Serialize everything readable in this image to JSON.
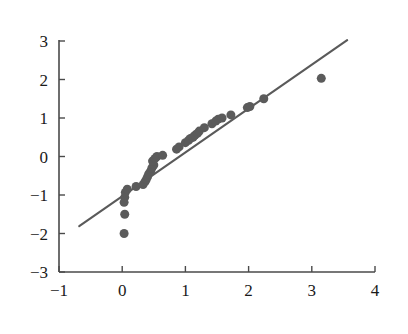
{
  "chart_data": {
    "type": "scatter",
    "title": "",
    "subtitle": "",
    "xlabel": "",
    "ylabel": "",
    "xlim": [
      -1,
      4
    ],
    "ylim": [
      -3,
      3
    ],
    "xticks": [
      -1,
      0,
      1,
      2,
      3,
      4
    ],
    "yticks": [
      -3,
      -2,
      -1,
      0,
      1,
      2,
      3
    ],
    "xtick_labels": [
      "−1",
      "0",
      "1",
      "2",
      "3",
      "4"
    ],
    "ytick_labels": [
      "−3",
      "−2",
      "−1",
      "0",
      "1",
      "2",
      "3"
    ],
    "grid": false,
    "legend": null,
    "marker_color": "#5b5b5b",
    "marker_size": 9,
    "line_color": "#5a5a5a",
    "axis_color": "#4a4a4a",
    "background_color": "#ffffff",
    "spines": [
      "left",
      "bottom"
    ],
    "reference_line": {
      "name": "reference-line",
      "x_start": -0.68,
      "y_start": -1.81,
      "x_end": 3.56,
      "y_end": 3.02,
      "slope": 1.14,
      "intercept": -1.03
    },
    "series": [
      {
        "name": "observations",
        "points": [
          [
            0.03,
            -2.0
          ],
          [
            0.04,
            -1.5
          ],
          [
            0.03,
            -1.19
          ],
          [
            0.04,
            -1.06
          ],
          [
            0.05,
            -0.93
          ],
          [
            0.08,
            -0.85
          ],
          [
            0.22,
            -0.78
          ],
          [
            0.33,
            -0.73
          ],
          [
            0.36,
            -0.66
          ],
          [
            0.38,
            -0.6
          ],
          [
            0.4,
            -0.53
          ],
          [
            0.42,
            -0.45
          ],
          [
            0.45,
            -0.38
          ],
          [
            0.47,
            -0.3
          ],
          [
            0.5,
            -0.22
          ],
          [
            0.48,
            -0.12
          ],
          [
            0.52,
            -0.05
          ],
          [
            0.55,
            0.0
          ],
          [
            0.64,
            0.03
          ],
          [
            0.86,
            0.19
          ],
          [
            0.9,
            0.25
          ],
          [
            1.0,
            0.36
          ],
          [
            1.05,
            0.42
          ],
          [
            1.08,
            0.47
          ],
          [
            1.12,
            0.5
          ],
          [
            1.15,
            0.55
          ],
          [
            1.19,
            0.6
          ],
          [
            1.22,
            0.66
          ],
          [
            1.3,
            0.75
          ],
          [
            1.42,
            0.85
          ],
          [
            1.48,
            0.92
          ],
          [
            1.52,
            0.97
          ],
          [
            1.58,
            1.0
          ],
          [
            1.72,
            1.08
          ],
          [
            1.98,
            1.27
          ],
          [
            2.02,
            1.3
          ],
          [
            2.24,
            1.5
          ],
          [
            3.15,
            2.03
          ]
        ]
      }
    ]
  },
  "figure": {
    "width": 408,
    "height": 334,
    "plot_left_px": 59,
    "plot_right_px": 375,
    "plot_top_px": 41,
    "plot_bottom_px": 272
  }
}
